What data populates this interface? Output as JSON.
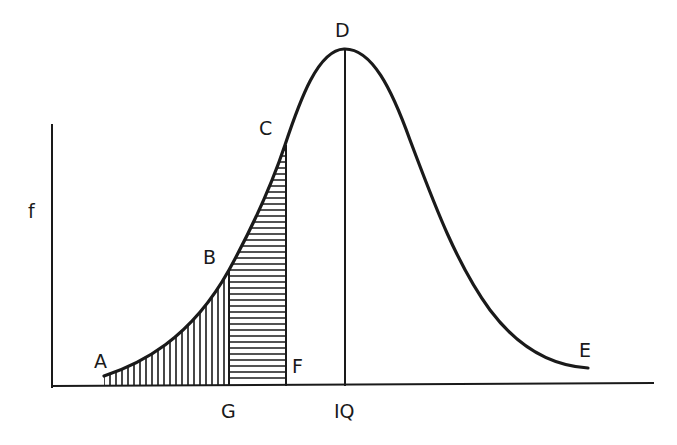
{
  "diagram": {
    "type": "distribution-curve",
    "y_axis_label": "f",
    "points": {
      "A": "A",
      "B": "B",
      "C": "C",
      "D": "D",
      "E": "E",
      "F": "F"
    },
    "x_axis_labels": {
      "G": "G",
      "IQ": "IQ"
    },
    "regions": [
      {
        "name": "A-B-G",
        "hatch": "vertical"
      },
      {
        "name": "G-B-C-F",
        "hatch": "horizontal"
      }
    ],
    "colors": {
      "stroke": "#1a1a1a",
      "background": "#ffffff"
    }
  }
}
